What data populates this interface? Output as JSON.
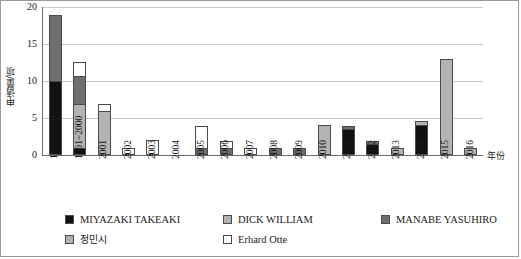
{
  "chart_data": {
    "type": "bar",
    "stacked": true,
    "title": "",
    "xlabel": "年份",
    "ylabel": "申请量/项",
    "ylim": [
      0,
      20
    ],
    "yticks": [
      0,
      5,
      10,
      15,
      20
    ],
    "grid": true,
    "legend_position": "bottom",
    "categories": [
      "1975~1990",
      "1991~2000",
      "2001",
      "2002",
      "2003",
      "2004",
      "2005",
      "2006",
      "2007",
      "2008",
      "2009",
      "2010",
      "2011",
      "2012",
      "2013",
      "2014",
      "2015",
      "2016"
    ],
    "series": [
      {
        "name": "MIYAZAKI TAKEAKI",
        "color": "#111111",
        "values": [
          10,
          1,
          0,
          0,
          0,
          0,
          0,
          0,
          0,
          0,
          0,
          0,
          3.5,
          1.5,
          0,
          4,
          0,
          0
        ]
      },
      {
        "name": "DICK WILLIAM",
        "color": "#b3b3b3",
        "values": [
          0,
          6,
          6,
          0,
          0,
          0,
          0,
          0,
          0,
          0,
          0,
          4,
          0,
          0,
          1,
          0.7,
          13,
          1
        ]
      },
      {
        "name": "MANABE YASUHIRO",
        "color": "#6e6e6e",
        "values": [
          9,
          4,
          0,
          0,
          0,
          0,
          1,
          1,
          0,
          1,
          1,
          0,
          0.5,
          0.5,
          0,
          0,
          0,
          0
        ]
      },
      {
        "name": "정민시",
        "color": "#b3b3b3",
        "values": [
          0,
          0,
          0,
          0,
          0,
          0,
          0,
          0,
          0,
          0,
          0,
          0,
          0,
          0,
          0,
          0,
          0,
          0
        ]
      },
      {
        "name": "Erhard Otte",
        "color": "#ffffff",
        "values": [
          0,
          2,
          1,
          1,
          2,
          0,
          3,
          1,
          1,
          0,
          0,
          0,
          0,
          0,
          0,
          0,
          0,
          0
        ]
      }
    ],
    "totals": [
      19,
      13,
      7,
      1,
      2,
      0,
      4,
      2,
      1,
      1,
      1,
      4,
      4,
      2,
      1,
      4.7,
      13,
      1
    ]
  },
  "axis": {
    "y_label": "申请量/项",
    "x_label": "年份",
    "y_ticks": [
      "0",
      "5",
      "10",
      "15",
      "20"
    ]
  },
  "legend": {
    "rows": [
      [
        {
          "label": "MIYAZAKI TAKEAKI",
          "color": "#111111",
          "cjk": false
        },
        {
          "label": "DICK WILLIAM",
          "color": "#b3b3b3",
          "cjk": false
        },
        {
          "label": "MANABE YASUHIRO",
          "color": "#6e6e6e",
          "cjk": false
        }
      ],
      [
        {
          "label": "정민시",
          "color": "#b3b3b3",
          "cjk": true
        },
        {
          "label": "Erhard Otte",
          "color": "#ffffff",
          "cjk": false
        }
      ]
    ]
  },
  "colors": {
    "miyazaki": "#111111",
    "dick_william": "#b3b3b3",
    "manabe": "#6e6e6e",
    "jeong": "#b3b3b3",
    "erhard": "#ffffff",
    "gridline": "#c9c9c9",
    "axis": "#6d6d6d",
    "frame": "#9a9a9a"
  }
}
